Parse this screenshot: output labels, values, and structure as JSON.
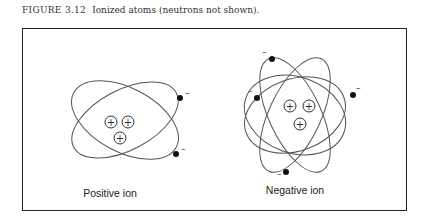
{
  "caption": {
    "number": "FIGURE 3.12",
    "title": "Ionized atoms (neutrons not shown)."
  },
  "diagrams": [
    {
      "label": "Positive ion",
      "protons": 3,
      "electrons": 2,
      "orbits": 2
    },
    {
      "label": "Negative ion",
      "protons": 3,
      "electrons": 4,
      "orbits": 4
    }
  ],
  "symbols": {
    "proton": "+",
    "electron": "–"
  }
}
